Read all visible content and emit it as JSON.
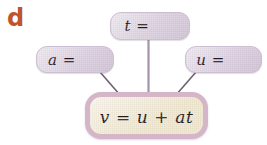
{
  "figure": {
    "panel_label": "d",
    "panel_label_color": "#c0542a",
    "background_color": "#ffffff"
  },
  "nodes": {
    "t": {
      "label": "t =",
      "name": "t",
      "fill_color": "#d9cedd"
    },
    "a": {
      "label": "a =",
      "name": "a",
      "fill_color": "#d9cedd"
    },
    "u": {
      "label": "u =",
      "name": "u",
      "fill_color": "#d9cedd"
    },
    "result": {
      "label": "v = u + at",
      "name": "v",
      "fill_color": "#efe8cd",
      "border_color": "#d4b6c8"
    }
  },
  "connectors": [
    {
      "from": "t",
      "to": "result",
      "style": "straight-vertical",
      "color": "#a393ab"
    },
    {
      "from": "a",
      "to": "result",
      "style": "diagonal",
      "color": "#6e6070"
    },
    {
      "from": "u",
      "to": "result",
      "style": "diagonal",
      "color": "#6e6070"
    }
  ]
}
